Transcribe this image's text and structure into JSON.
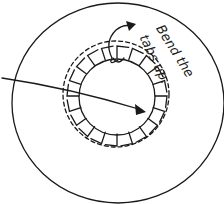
{
  "diagram": {
    "label_line1": "Bend the",
    "label_line2": "tabs up.",
    "ink_color": "#1a1a1a",
    "background": "#ffffff",
    "shapes": {
      "outer_circle": "outer-disc",
      "inner_circle": "center-hole",
      "dashed_circle": "fold-line",
      "tabs": "cut-tabs",
      "pointer_arrow": "arrow-to-center",
      "curved_arrow": "bend-up-arrow"
    }
  }
}
